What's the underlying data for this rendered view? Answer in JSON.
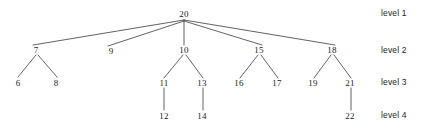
{
  "diagram": {
    "type": "tree",
    "background_color": "#ffffff",
    "node_text_color": "#201d1c",
    "edge_color": "#3a3a3a",
    "label_color": "#231f20",
    "root_value": "20",
    "levels": [
      {
        "label": "level 1",
        "y": 13,
        "node_values": [
          "20"
        ]
      },
      {
        "label": "level 2",
        "y": 50,
        "node_values": [
          "7",
          "9",
          "10",
          "15",
          "18"
        ]
      },
      {
        "label": "level 3",
        "y": 82,
        "node_values": [
          "6",
          "8",
          "11",
          "13",
          "16",
          "17",
          "19",
          "21"
        ]
      },
      {
        "label": "level 4",
        "y": 115,
        "node_values": [
          "12",
          "14",
          "22"
        ]
      }
    ],
    "nodes": [
      {
        "id": "n20",
        "value": "20",
        "level": 1,
        "x": 184,
        "y": 14
      },
      {
        "id": "n7",
        "value": "7",
        "level": 2,
        "x": 36,
        "y": 50
      },
      {
        "id": "n9",
        "value": "9",
        "level": 2,
        "x": 111,
        "y": 51
      },
      {
        "id": "n10",
        "value": "10",
        "level": 2,
        "x": 184,
        "y": 50
      },
      {
        "id": "n15",
        "value": "15",
        "level": 2,
        "x": 259,
        "y": 50
      },
      {
        "id": "n18",
        "value": "18",
        "level": 2,
        "x": 332,
        "y": 50
      },
      {
        "id": "n6",
        "value": "6",
        "level": 3,
        "x": 18,
        "y": 83
      },
      {
        "id": "n8",
        "value": "8",
        "level": 3,
        "x": 56,
        "y": 83
      },
      {
        "id": "n11",
        "value": "11",
        "level": 3,
        "x": 164,
        "y": 83
      },
      {
        "id": "n13",
        "value": "13",
        "level": 3,
        "x": 202,
        "y": 83
      },
      {
        "id": "n16",
        "value": "16",
        "level": 3,
        "x": 239,
        "y": 83
      },
      {
        "id": "n17",
        "value": "17",
        "level": 3,
        "x": 277,
        "y": 83
      },
      {
        "id": "n19",
        "value": "19",
        "level": 3,
        "x": 313,
        "y": 83
      },
      {
        "id": "n21",
        "value": "21",
        "level": 3,
        "x": 350,
        "y": 83
      },
      {
        "id": "n12",
        "value": "12",
        "level": 4,
        "x": 164,
        "y": 116
      },
      {
        "id": "n14",
        "value": "14",
        "level": 4,
        "x": 202,
        "y": 116
      },
      {
        "id": "n22",
        "value": "22",
        "level": 4,
        "x": 350,
        "y": 116
      }
    ],
    "edges": [
      {
        "from": "n20",
        "to": "n7",
        "x1": 184,
        "y1": 20,
        "x2": 33,
        "y2": 45
      },
      {
        "from": "n20",
        "to": "n9",
        "x1": 184,
        "y1": 21,
        "x2": 108,
        "y2": 46
      },
      {
        "from": "n20",
        "to": "n10",
        "x1": 184,
        "y1": 20,
        "x2": 184,
        "y2": 45
      },
      {
        "from": "n20",
        "to": "n15",
        "x1": 184,
        "y1": 21,
        "x2": 262,
        "y2": 45
      },
      {
        "from": "n20",
        "to": "n18",
        "x1": 184,
        "y1": 20,
        "x2": 335,
        "y2": 45
      },
      {
        "from": "n7",
        "to": "n6",
        "x1": 36,
        "y1": 55,
        "x2": 18,
        "y2": 77
      },
      {
        "from": "n7",
        "to": "n8",
        "x1": 38,
        "y1": 55,
        "x2": 57,
        "y2": 77
      },
      {
        "from": "n10",
        "to": "n11",
        "x1": 183,
        "y1": 55,
        "x2": 164,
        "y2": 78
      },
      {
        "from": "n10",
        "to": "n13",
        "x1": 186,
        "y1": 55,
        "x2": 203,
        "y2": 78
      },
      {
        "from": "n15",
        "to": "n16",
        "x1": 258,
        "y1": 55,
        "x2": 240,
        "y2": 78
      },
      {
        "from": "n15",
        "to": "n17",
        "x1": 261,
        "y1": 55,
        "x2": 278,
        "y2": 78
      },
      {
        "from": "n18",
        "to": "n19",
        "x1": 331,
        "y1": 55,
        "x2": 314,
        "y2": 78
      },
      {
        "from": "n18",
        "to": "n21",
        "x1": 334,
        "y1": 55,
        "x2": 351,
        "y2": 78
      },
      {
        "from": "n11",
        "to": "n12",
        "x1": 164,
        "y1": 88,
        "x2": 164,
        "y2": 110
      },
      {
        "from": "n13",
        "to": "n14",
        "x1": 203,
        "y1": 88,
        "x2": 203,
        "y2": 110
      },
      {
        "from": "n21",
        "to": "n22",
        "x1": 351,
        "y1": 88,
        "x2": 351,
        "y2": 110
      }
    ],
    "level_labels": [
      {
        "text": "level 1",
        "x": 381,
        "y": 13
      },
      {
        "text": "level 2",
        "x": 381,
        "y": 50
      },
      {
        "text": "level 3",
        "x": 381,
        "y": 82
      },
      {
        "text": "level 4",
        "x": 381,
        "y": 115
      }
    ]
  }
}
